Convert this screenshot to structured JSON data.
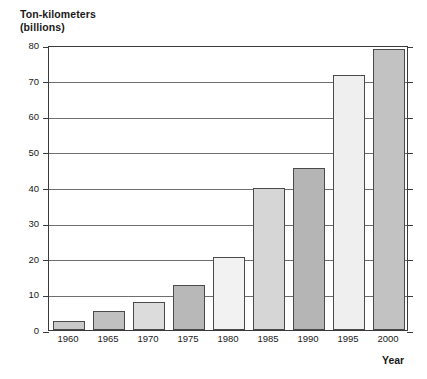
{
  "chart_data": {
    "type": "bar",
    "title": "",
    "ylabel": "Ton-kilometers\n(billions)",
    "ylabel_line1": "Ton-kilometers",
    "ylabel_line2": "(billions)",
    "xlabel": "Year",
    "categories": [
      "1960",
      "1965",
      "1970",
      "1975",
      "1980",
      "1985",
      "1990",
      "1995",
      "2000"
    ],
    "values": [
      2.5,
      5.3,
      7.8,
      12.5,
      20.5,
      39.8,
      45.5,
      71.5,
      79.0
    ],
    "bar_colors": [
      "#c9c9c9",
      "#c0c0c0",
      "#dcdcdc",
      "#b8b8b8",
      "#f2f2f2",
      "#d6d6d6",
      "#b5b5b5",
      "#efefef",
      "#c2c2c2"
    ],
    "bar_border_color": "#4a4a4a",
    "ylim": [
      0,
      80
    ],
    "yticks": [
      0,
      10,
      20,
      30,
      40,
      50,
      60,
      70,
      80
    ],
    "ytick_labels": [
      "0",
      "10",
      "20",
      "30",
      "40",
      "50",
      "60",
      "70",
      "80"
    ],
    "grid": true,
    "grid_color": "#6f6f6f",
    "frame_color": "#3a3a3a",
    "legend": false,
    "background": "#ffffff"
  }
}
